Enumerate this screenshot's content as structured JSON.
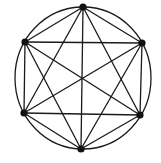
{
  "diagram": {
    "type": "complete-graph",
    "name": "K6 inscribed in circle",
    "colors": {
      "stroke": "#1a1a1a",
      "node": "#111111",
      "background": "#ffffff"
    },
    "circle": {
      "cx": 83,
      "cy": 78,
      "rx": 68,
      "ry": 71
    },
    "nodes": [
      {
        "id": "top",
        "x": 83,
        "y": 7
      },
      {
        "id": "upper-right",
        "x": 142,
        "y": 43
      },
      {
        "id": "lower-right",
        "x": 140,
        "y": 115
      },
      {
        "id": "bottom",
        "x": 81,
        "y": 149
      },
      {
        "id": "lower-left",
        "x": 24,
        "y": 113
      },
      {
        "id": "upper-left",
        "x": 25,
        "y": 42
      }
    ],
    "edges": [
      [
        "top",
        "upper-right"
      ],
      [
        "top",
        "lower-right"
      ],
      [
        "top",
        "bottom"
      ],
      [
        "top",
        "lower-left"
      ],
      [
        "top",
        "upper-left"
      ],
      [
        "upper-right",
        "lower-right"
      ],
      [
        "upper-right",
        "bottom"
      ],
      [
        "upper-right",
        "lower-left"
      ],
      [
        "upper-right",
        "upper-left"
      ],
      [
        "lower-right",
        "bottom"
      ],
      [
        "lower-right",
        "lower-left"
      ],
      [
        "lower-right",
        "upper-left"
      ],
      [
        "bottom",
        "lower-left"
      ],
      [
        "bottom",
        "upper-left"
      ],
      [
        "lower-left",
        "upper-left"
      ]
    ]
  }
}
